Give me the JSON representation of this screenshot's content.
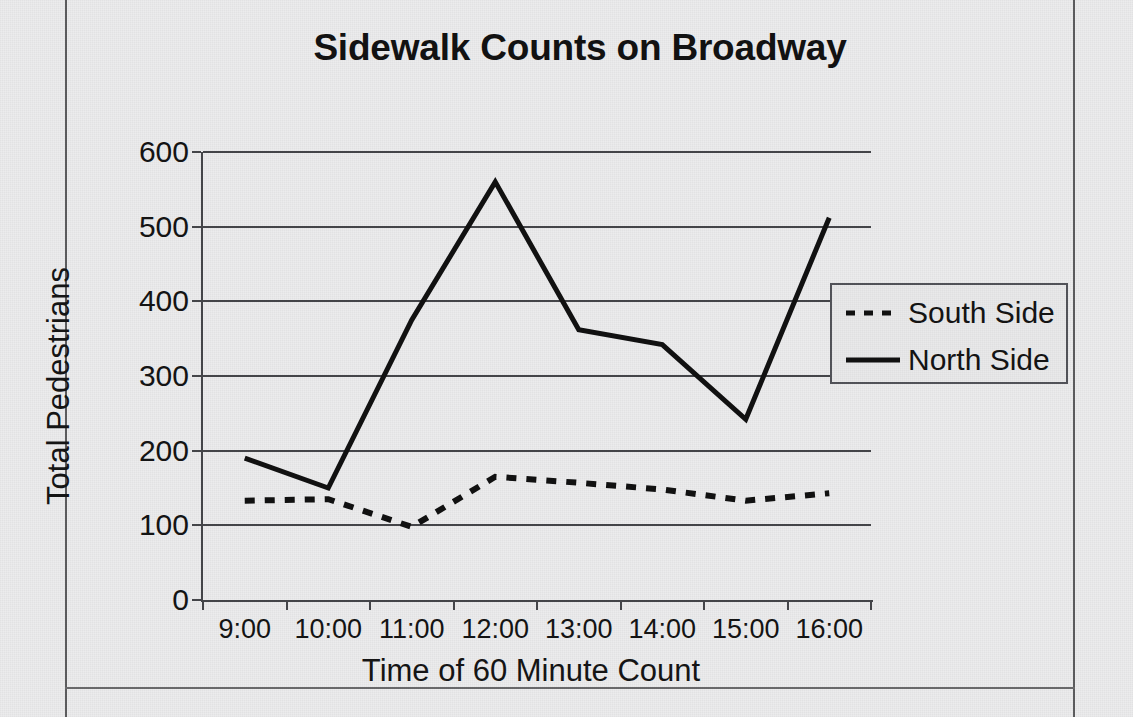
{
  "chart_data": {
    "type": "line",
    "title": "Sidewalk Counts on Broadway",
    "xlabel": "Time of 60 Minute Count",
    "ylabel": "Total Pedestrians",
    "categories": [
      "9:00",
      "10:00",
      "11:00",
      "12:00",
      "13:00",
      "14:00",
      "15:00",
      "16:00"
    ],
    "ylim": [
      0,
      600
    ],
    "yticks": [
      0,
      100,
      200,
      300,
      400,
      500,
      600
    ],
    "grid": "horizontal",
    "legend_position": "right",
    "series": [
      {
        "name": "South Side",
        "style": "dashed",
        "color": "#111111",
        "values": [
          133,
          135,
          98,
          165,
          157,
          148,
          133,
          143
        ]
      },
      {
        "name": "North Side",
        "style": "solid",
        "color": "#111111",
        "values": [
          190,
          150,
          375,
          560,
          362,
          342,
          242,
          512
        ]
      }
    ]
  },
  "legend": {
    "items": [
      {
        "label": "South Side",
        "marker": "dashed-line-swatch"
      },
      {
        "label": "North Side",
        "marker": "solid-line-swatch"
      }
    ]
  },
  "colors": {
    "page_background": "#ececed",
    "axis": "#45464a",
    "text": "#141414",
    "series": "#111111"
  }
}
